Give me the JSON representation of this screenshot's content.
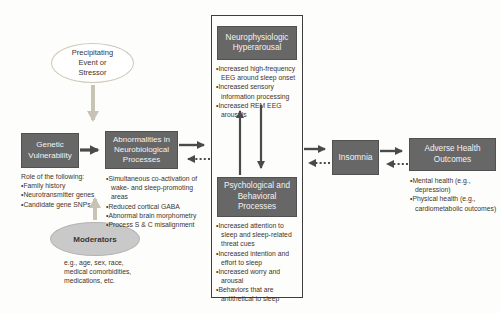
{
  "diagram": {
    "precipitating": {
      "label": "Precipitating Event or Stressor"
    },
    "genetic": {
      "label": "Genetic Vulnerability",
      "note_heading": "Role of the following:",
      "bullets": [
        "Family history",
        "Neurotransmitter genes",
        "Candidate gene SNPs"
      ]
    },
    "abnormalities": {
      "label": "Abnormalities in Neurobiological Processes",
      "bullets": [
        "Simultaneous co-activation of wake- and sleep-promoting areas",
        "Reduced cortical GABA",
        "Abnormal brain morphometry",
        "Process S & C misalignment"
      ]
    },
    "moderators": {
      "label": "Moderators",
      "note": "e.g., age, sex, race, medical comorbidities, medications, etc."
    },
    "neurophysiologic": {
      "label": "Neurophysiologic Hyperarousal",
      "bullets": [
        "Increased high-frequency EEG around sleep onset",
        "Increased sensory information processing",
        "Increased REM EEG arousals"
      ]
    },
    "psychological": {
      "label": "Psychological and Behavioral Processes",
      "bullets": [
        "Increased attention to sleep and sleep-related threat cues",
        "Increased intention and effort to sleep",
        "Increased worry and arousal",
        "Behaviors that are antithetical to sleep"
      ]
    },
    "insomnia": {
      "label": "Insomnia"
    },
    "adverse": {
      "label": "Adverse Health Outcomes",
      "bullets": [
        "Mental health (e.g., depression)",
        "Physical health (e.g., cardiometabolic outcomes)"
      ]
    },
    "colors": {
      "box_fill": "#676767",
      "box_text": "#f3f3f3",
      "note_text": "#3f352d",
      "arrow_dark": "#4a4a4a",
      "arrow_light": "#c9c3b6",
      "moderators_fill": "#c9c9c9",
      "container_border": "#3d3d3d"
    }
  }
}
